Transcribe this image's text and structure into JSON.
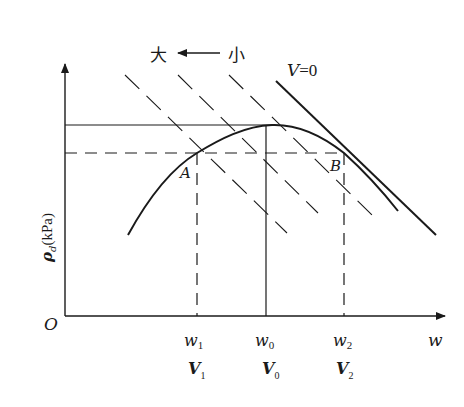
{
  "diagram": {
    "type": "compaction-curve",
    "labels": {
      "origin": "O",
      "x_axis": "w",
      "y_axis_symbol": "ρ",
      "y_axis_subscript": "d",
      "y_axis_unit": "(kPa)",
      "direction_large": "大",
      "direction_small": "小",
      "direction_arrow": "←",
      "zero_air_line_prefix": "V",
      "zero_air_line_suffix": "=0",
      "point_a": "A",
      "point_b": "B"
    },
    "x_ticks": [
      {
        "symbol": "w",
        "subscript": "1",
        "volume_symbol": "V",
        "volume_subscript": "1"
      },
      {
        "symbol": "w",
        "subscript": "0",
        "volume_symbol": "V",
        "volume_subscript": "0"
      },
      {
        "symbol": "w",
        "subscript": "2",
        "volume_symbol": "V",
        "volume_subscript": "2"
      }
    ],
    "dashed_compaction_lines_count": 3,
    "colors": {
      "line": "#1a1a1a",
      "background": "#ffffff"
    }
  }
}
